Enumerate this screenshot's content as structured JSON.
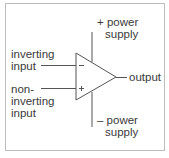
{
  "diagram": {
    "type": "op-amp schematic",
    "colors": {
      "stroke": "#555555",
      "text": "#3a3a3a",
      "frame": "#bdbdbd",
      "background": "#ffffff"
    },
    "symbol": {
      "minus_sign": "−",
      "plus_sign": "+"
    },
    "labels": {
      "positive_supply": {
        "line1": "+ power",
        "line2": "supply"
      },
      "negative_supply": {
        "line1": "– power",
        "line2": "supply"
      },
      "inverting_input": {
        "line1": "inverting",
        "line2": "input"
      },
      "non_inverting_input": {
        "line1": "non-",
        "line2": "inverting",
        "line3": "input"
      },
      "output": "output"
    }
  }
}
